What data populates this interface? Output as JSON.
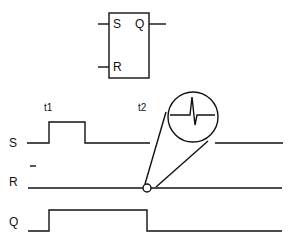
{
  "flipflop": {
    "inputs": [
      "S",
      "R"
    ],
    "output": "Q"
  },
  "time_markers": [
    {
      "label": "t1",
      "x": 49
    },
    {
      "label": "t2",
      "x": 147
    }
  ],
  "signals": [
    {
      "name": "S",
      "description": "Set pulse between t1 and ~t1+36px"
    },
    {
      "name": "R",
      "overline": true,
      "description": "Reset line with glitch at t2"
    },
    {
      "name": "Q",
      "description": "Output high from t1 to t2"
    }
  ],
  "magnifier": {
    "label": "glitch-detail"
  },
  "colors": {
    "stroke": "#111111",
    "background": "#ffffff"
  }
}
